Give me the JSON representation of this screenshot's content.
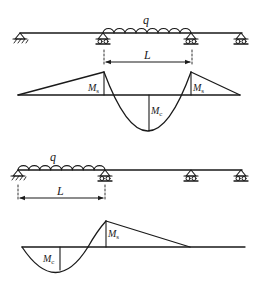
{
  "figure": {
    "background": "#ffffff",
    "ink": "#1a1a1a",
    "panels": [
      {
        "name": "top-continuous-beam",
        "beam": {
          "y": 33,
          "x_start": 20,
          "x_end": 242
        },
        "supports": [
          {
            "type": "pin",
            "x": 20
          },
          {
            "type": "roller",
            "x": 103
          },
          {
            "type": "roller",
            "x": 191
          },
          {
            "type": "roller",
            "x": 241
          }
        ],
        "load": {
          "label": "q",
          "x_start": 103,
          "x_end": 191
        },
        "dimension": {
          "label": "L",
          "x_start": 104,
          "x_end": 192,
          "y": 62
        },
        "moment_diagram": {
          "baseline_y": 95,
          "x_start": 18,
          "x_end": 240,
          "labels": {
            "left_support": "M",
            "left_support_sub": "s",
            "midspan": "M",
            "midspan_sub": "c",
            "right_support": "M",
            "right_support_sub": "s"
          }
        }
      },
      {
        "name": "bottom-continuous-beam",
        "beam": {
          "y": 170,
          "x_start": 18,
          "x_end": 242
        },
        "supports": [
          {
            "type": "pin",
            "x": 18
          },
          {
            "type": "roller",
            "x": 105
          },
          {
            "type": "roller",
            "x": 191
          },
          {
            "type": "roller",
            "x": 241
          }
        ],
        "load": {
          "label": "q",
          "x_start": 18,
          "x_end": 105
        },
        "dimension": {
          "label": "L",
          "x_start": 18,
          "x_end": 105,
          "y": 198
        },
        "moment_diagram": {
          "baseline_y": 247,
          "x_start": 22,
          "x_end": 245,
          "labels": {
            "midspan": "M",
            "midspan_sub": "c",
            "support": "M",
            "support_sub": "s"
          }
        }
      }
    ]
  }
}
